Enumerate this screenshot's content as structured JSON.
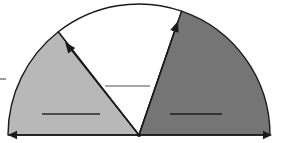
{
  "diagram": {
    "type": "geometry-diagram",
    "canvas": {
      "width": 282,
      "height": 143
    },
    "background_color": "#ffffff",
    "stroke_color": "#1a1a1a",
    "center": {
      "x": 139,
      "y": 135
    },
    "radius": 131,
    "baseline": {
      "name": "horizontal-axis",
      "y": 135,
      "x_start": 8,
      "x_end": 272,
      "arrow_left": true,
      "arrow_right": true
    },
    "sectors": [
      {
        "id": "left-sector",
        "name": "light-gray-sector",
        "fill_color": "#b8b8b8",
        "start_angle_deg": 128,
        "end_angle_deg": 180,
        "label_rule": {
          "name": "left-sector-label-rule",
          "x1": 42,
          "x2": 100,
          "y": 114,
          "color": "#2a2a2a"
        }
      },
      {
        "id": "middle-sector",
        "name": "white-sector",
        "fill_color": "#ffffff",
        "start_angle_deg": 71,
        "end_angle_deg": 128,
        "label_rule": {
          "name": "middle-sector-label-rule",
          "x1": 105,
          "x2": 150,
          "y": 86,
          "color": "#8a8a8a"
        }
      },
      {
        "id": "right-sector",
        "name": "dark-gray-sector",
        "fill_color": "#757575",
        "start_angle_deg": 0,
        "end_angle_deg": 71,
        "label_rule": {
          "name": "right-sector-label-rule",
          "x1": 170,
          "x2": 222,
          "y": 114,
          "color": "#1d1d1d"
        }
      }
    ],
    "radii": [
      {
        "id": "left-radius",
        "name": "left-radius-arrow",
        "from": {
          "x": 139,
          "y": 135
        },
        "to": {
          "x": 65,
          "y": 42
        },
        "arrow_at_end": true,
        "angle_deg": 128
      },
      {
        "id": "right-radius",
        "name": "right-radius-arrow",
        "from": {
          "x": 139,
          "y": 135
        },
        "to": {
          "x": 178,
          "y": 21
        },
        "arrow_at_end": true,
        "angle_deg": 71
      }
    ],
    "edge_tick": {
      "name": "left-edge-tick-mark",
      "x1": 0,
      "x2": 6,
      "y": 79,
      "color": "#555555"
    }
  }
}
